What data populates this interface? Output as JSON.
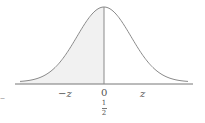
{
  "chart_data": {
    "type": "area",
    "title": "",
    "xlabel": "",
    "ylabel": "",
    "x_ticks": [
      "-z",
      "0",
      "z"
    ],
    "shaded_region": {
      "from": "-inf",
      "to": 0,
      "area_label": "1/2"
    },
    "peak_at": 0,
    "grid": false,
    "legend": null
  },
  "labels": {
    "neg_z": "−z",
    "zero": "0",
    "pos_z": "z",
    "half_num": "1",
    "half_den": "2",
    "left_dash": "–"
  },
  "colors": {
    "curve": "#8a8a8a",
    "shade": "#f1f1f1",
    "axis": "#777777"
  }
}
